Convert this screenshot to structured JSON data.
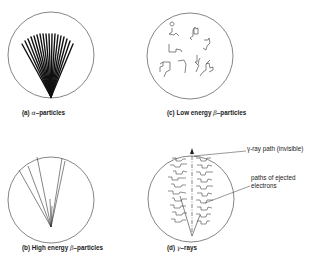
{
  "figure": {
    "panels": [
      {
        "id": "a",
        "prefix": "(a) ",
        "symbol": "α",
        "suffix": "–particles",
        "description": "dense straight thick tracks fanning from a point"
      },
      {
        "id": "b",
        "prefix": "(b) High energy ",
        "symbol": "β",
        "suffix": "–particles",
        "description": "few thin long straight tracks"
      },
      {
        "id": "c",
        "prefix": "(c) Low energy ",
        "symbol": "β",
        "suffix": "–particles",
        "description": "short tortuous scattered tracks"
      },
      {
        "id": "d",
        "prefix": "(d) ",
        "symbol": "γ",
        "suffix": "–rays",
        "description": "invisible straight path with side electron tracks"
      }
    ],
    "annotations": {
      "gamma_path": "γ-ray path (invisible)",
      "electrons_line1": "paths of ejected",
      "electrons_line2": "electrons"
    },
    "colors": {
      "stroke": "#1a1a1a",
      "background": "#ffffff"
    }
  }
}
